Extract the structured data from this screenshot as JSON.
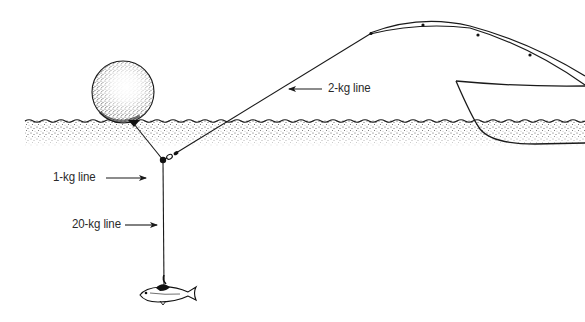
{
  "diagram": {
    "type": "fishing-rig-illustration",
    "colors": {
      "ink": "#1a1a1a",
      "label": "#2a2a2a",
      "background": "#ffffff"
    },
    "labels": {
      "one_kg": "1-kg line",
      "two_kg": "2-kg line",
      "twenty_kg": "20-kg line"
    },
    "elements": {
      "buoy": "float-buoy",
      "water": "water-surface",
      "rod": "fishing-rod",
      "boat": "boat-hull",
      "fish": "bait-fish",
      "swivel": "swivel-clip"
    }
  }
}
